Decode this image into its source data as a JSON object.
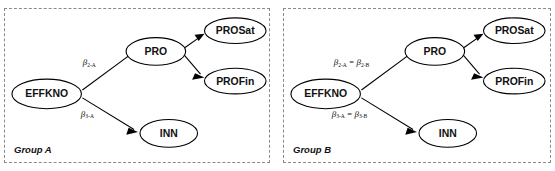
{
  "figure": {
    "background_color": "#ffffff",
    "line_color": "#000000",
    "panel_border_color": "#8a8a8a"
  },
  "panels": [
    {
      "id": "group-a",
      "caption": "Group A",
      "nodes": {
        "effkno": "EFFKNO",
        "pro": "PRO",
        "inn": "INN",
        "prosat": "PROSat",
        "profin": "PROFin"
      },
      "path_labels": {
        "effkno_to_pro": {
          "beta": "β",
          "subscript": "2-A",
          "full": "β₂₋ₐ"
        },
        "effkno_to_inn": {
          "beta": "β",
          "subscript": "3-A",
          "full": "β₃₋ₐ"
        }
      }
    },
    {
      "id": "group-b",
      "caption": "Group B",
      "nodes": {
        "effkno": "EFFKNO",
        "pro": "PRO",
        "inn": "INN",
        "prosat": "PROSat",
        "profin": "PROFin"
      },
      "path_labels": {
        "effkno_to_pro": {
          "beta": "β",
          "subscript": "2-A",
          "equals": "=",
          "beta2": "β",
          "subscript2": "2-B",
          "full": "β₂₋ₐ = β₂₋ᵦ"
        },
        "effkno_to_inn": {
          "beta": "β",
          "subscript": "3-A",
          "equals": "=",
          "beta2": "β",
          "subscript2": "3-B",
          "full": "β₃₋ₐ = β₃₋ᵦ"
        }
      }
    }
  ]
}
